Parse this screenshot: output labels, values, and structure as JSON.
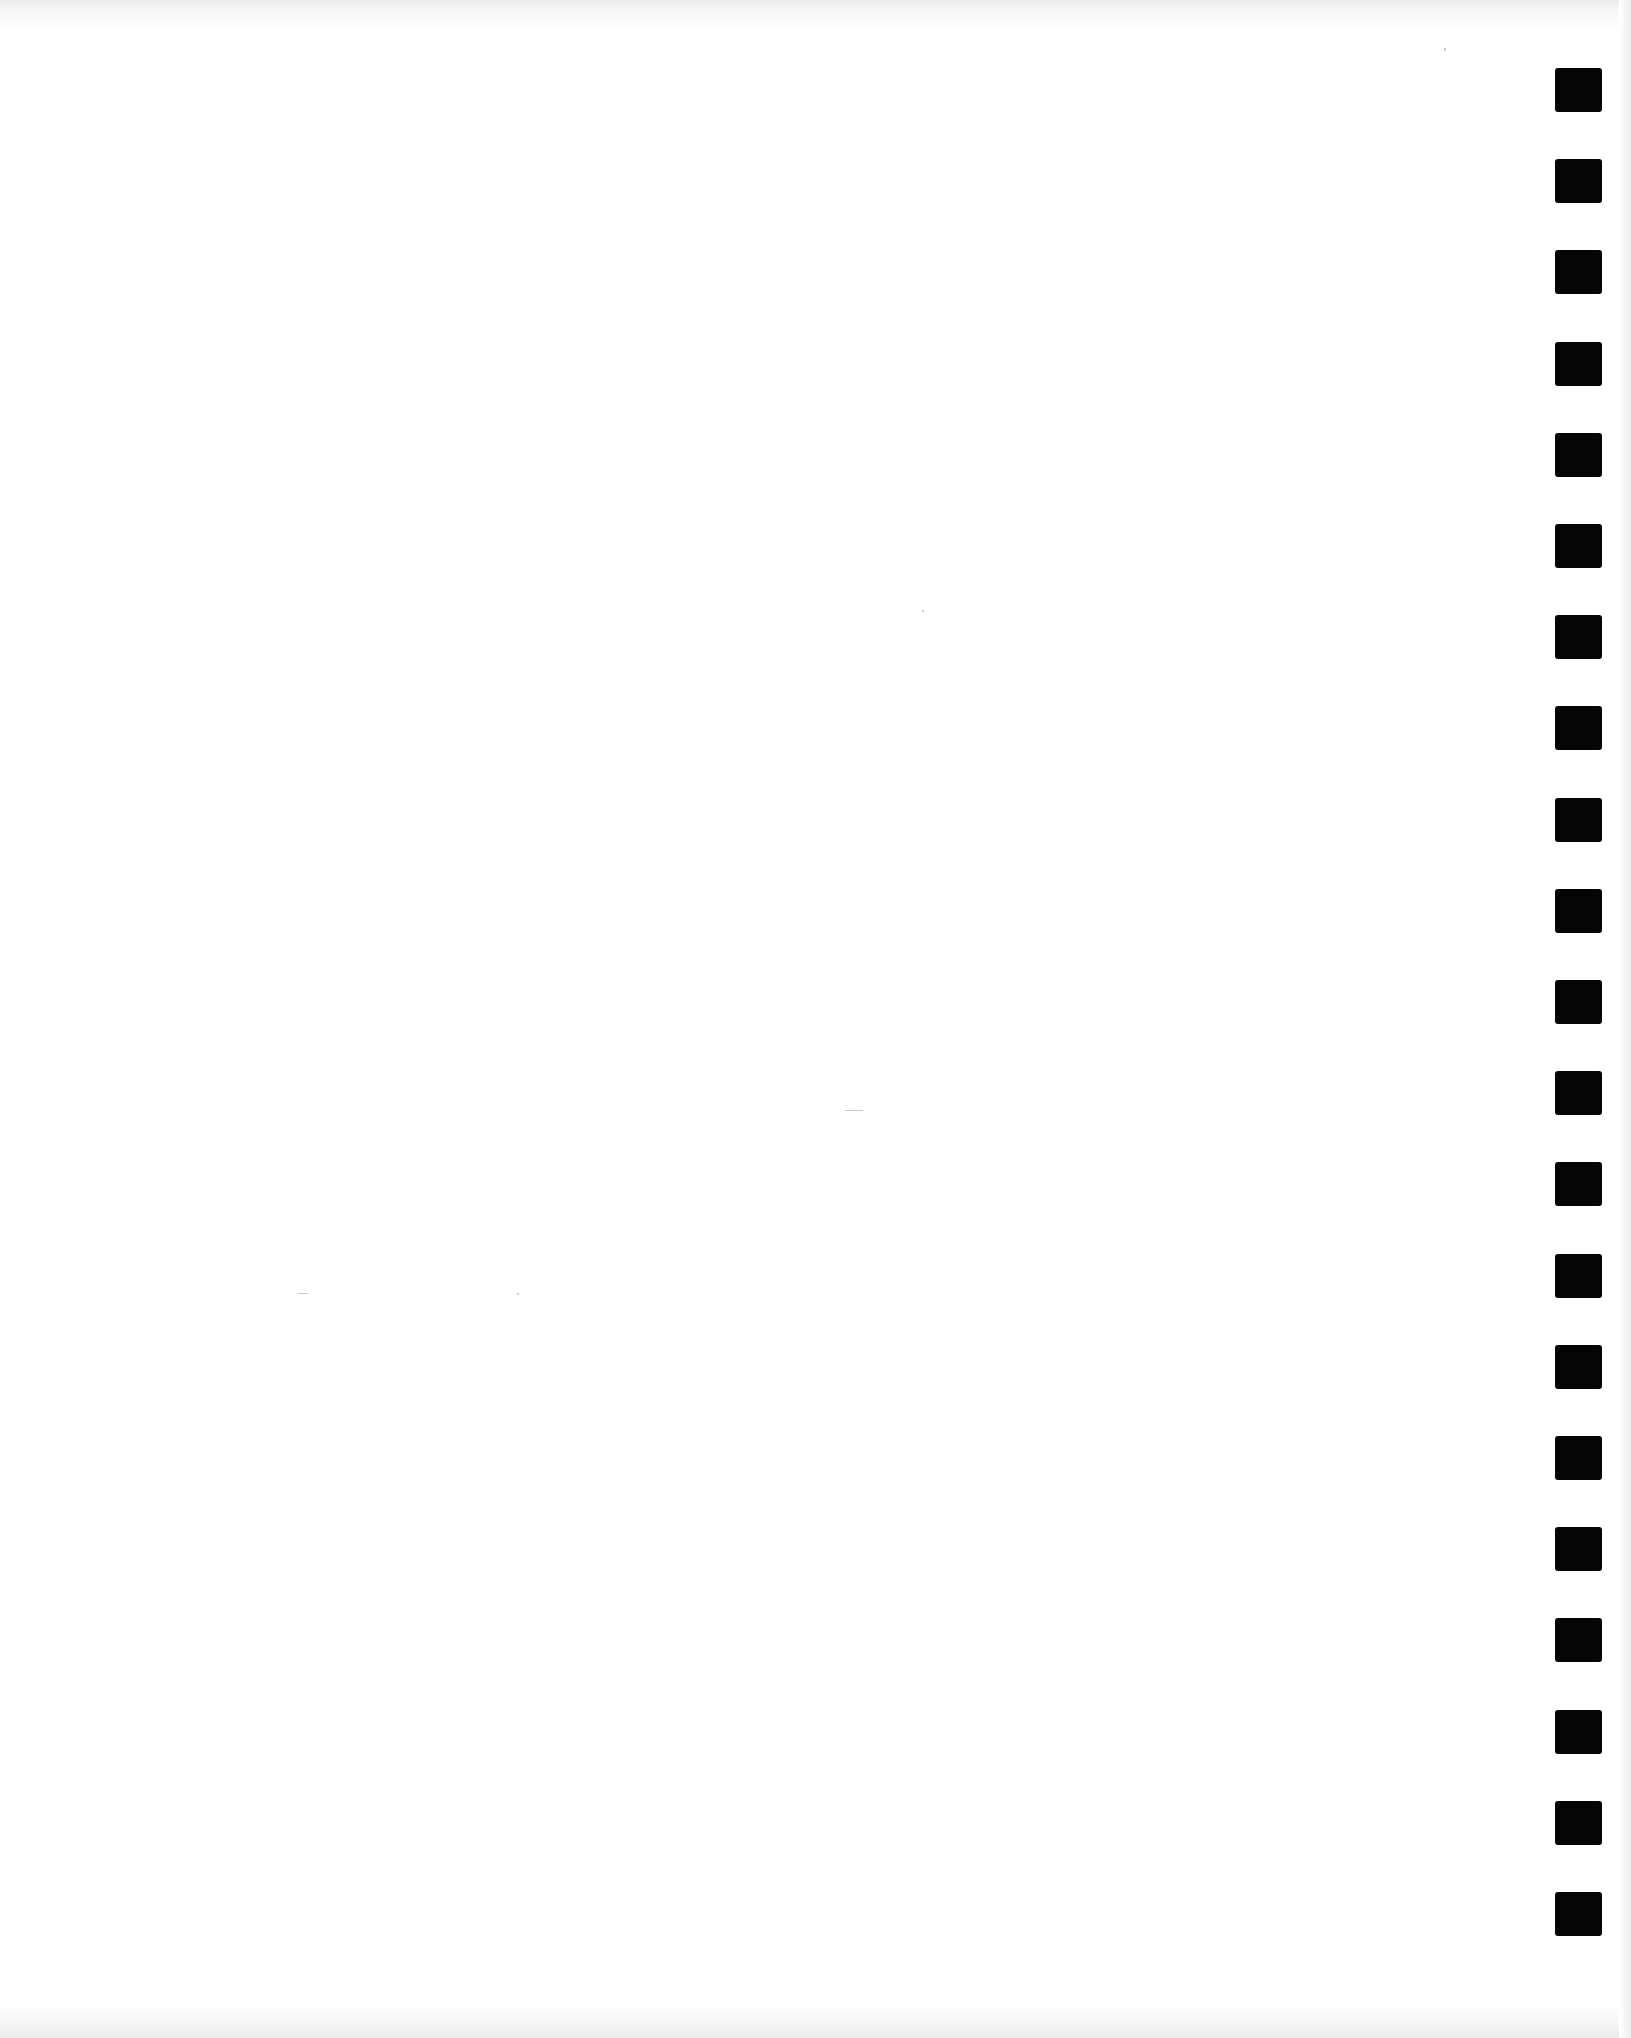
{
  "document": {
    "type": "blank scanned page",
    "text_content": "",
    "background_color": "#ffffff"
  },
  "punch_holes": {
    "count": 21,
    "color": "#050505",
    "left_px": 1555,
    "first_top_px": 68,
    "spacing_px": 91.2,
    "width_px": 47,
    "height_px": 44
  }
}
